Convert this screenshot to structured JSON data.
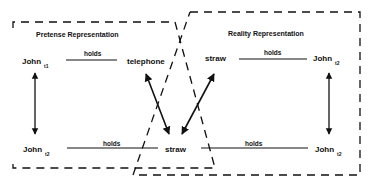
{
  "diagram": {
    "pretense": {
      "title": "Pretense Representation",
      "top_left": {
        "name": "John",
        "sub": "t1"
      },
      "top_relation": "holds",
      "top_right": "telephone",
      "bottom_left": {
        "name": "John",
        "sub": "t2"
      },
      "bottom_relation": "holds"
    },
    "shared": {
      "bottom_center": "straw"
    },
    "reality": {
      "title": "Reality Representation",
      "top_left": "straw",
      "top_relation": "holds",
      "top_right": {
        "name": "John",
        "sub": "t2"
      },
      "bottom_relation": "holds",
      "bottom_right": {
        "name": "John",
        "sub": "t2"
      }
    },
    "colors": {
      "line": "#111111",
      "background": "#ffffff"
    }
  }
}
